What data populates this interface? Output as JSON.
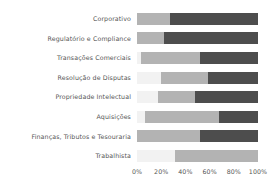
{
  "chart_data": {
    "type": "bar",
    "subtype": "stacked-horizontal-100",
    "title": "",
    "xlabel": "",
    "ylabel": "",
    "xlim": [
      0,
      100
    ],
    "grid": false,
    "legend": "none",
    "x_ticks": [
      "0%",
      "20%",
      "40%",
      "60%",
      "80%",
      "100%"
    ],
    "x_tick_values": [
      0,
      20,
      40,
      60,
      80,
      100
    ],
    "categories": [
      "Corporativo",
      "Regulatório e Compliance",
      "Transações Comerciais",
      "Resolução de Disputas",
      "Propriedade Intelectual",
      "Aquisições",
      "Finanças, Tributos e Tesouraria",
      "Trabalhista"
    ],
    "series": [
      {
        "name": "Segmento 1",
        "color": "#f2f2f2",
        "values": [
          0,
          0,
          3,
          20,
          17,
          7,
          0,
          31
        ]
      },
      {
        "name": "Segmento 2",
        "color": "#b3b3b3",
        "values": [
          27,
          22,
          49,
          39,
          31,
          61,
          52,
          69
        ]
      },
      {
        "name": "Segmento 3",
        "color": "#4d4d4d",
        "values": [
          73,
          78,
          48,
          41,
          52,
          32,
          48,
          0
        ]
      }
    ]
  },
  "colors": {
    "segment_light": "#f2f2f2",
    "segment_medium": "#b3b3b3",
    "segment_dark": "#4d4d4d",
    "text": "#555555",
    "background": "#ffffff"
  }
}
